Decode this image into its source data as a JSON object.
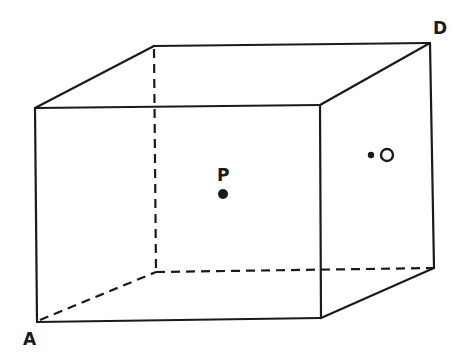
{
  "diagram": {
    "colors": {
      "line": "#1a1a1a",
      "background": "#ffffff"
    },
    "vertices": {
      "front_top_left": [
        35,
        108
      ],
      "front_top_right": [
        320,
        105
      ],
      "front_bottom_right": [
        321,
        318
      ],
      "front_bottom_left_A": [
        37,
        322
      ],
      "back_top_left": [
        154,
        46
      ],
      "back_top_right_D": [
        430,
        43
      ],
      "back_bottom_right": [
        434,
        268
      ],
      "back_bottom_left_hidden": [
        156,
        272
      ]
    },
    "labels": {
      "A": "A",
      "D": "D",
      "P": "P",
      "O": "O"
    },
    "points": [
      {
        "name": "P",
        "description": "filled point at center of the box",
        "x": 223,
        "y": 194
      },
      {
        "name": "O",
        "description": "point on right face, labeled O",
        "x": 371,
        "y": 155
      }
    ]
  }
}
